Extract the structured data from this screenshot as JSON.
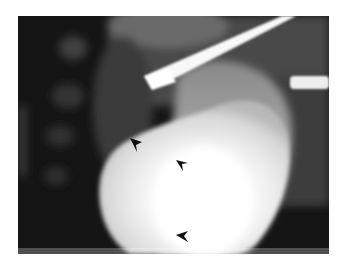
{
  "image": {
    "kind": "fluoroscopic radiograph",
    "frame": {
      "x": 18,
      "y": 16,
      "width": 311,
      "height": 238
    },
    "background_color": "#ffffff",
    "colors": {
      "dark_background": "#151515",
      "soft_tissue": "#5a5a5a",
      "contrast_organ": "#f4f4f4",
      "instrument": "#f8f8f8",
      "arrowhead": "#111111"
    },
    "elements": {
      "instrument_diagonal": "white rod entering from upper right, tip at upper center",
      "instrument_horizontal": "short white rod at right edge",
      "organ": "large bright contrast-filled structure occupying lower center",
      "spine": "faint vertebral bodies along left side"
    },
    "arrowheads": [
      {
        "x": 136,
        "y": 145,
        "direction": "down"
      },
      {
        "x": 183,
        "y": 159,
        "direction": "left"
      },
      {
        "x": 182,
        "y": 233,
        "direction": "left"
      }
    ]
  }
}
